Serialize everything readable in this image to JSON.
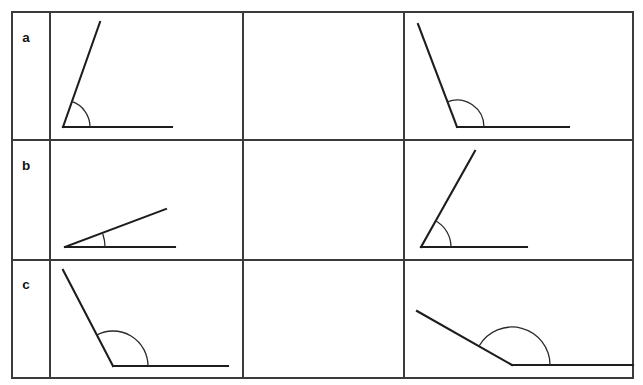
{
  "worksheet": {
    "title": "Angle identification worksheet",
    "background_color": "#ffffff",
    "line_color": "#1d1d1d",
    "grid_color": "#3b3b3b",
    "arc_color": "#2a2a2a",
    "width": 643,
    "height": 385
  },
  "table": {
    "left": 12,
    "top": 12,
    "right": 633,
    "bottom": 378,
    "label_column_divider_x": 50,
    "column_divider_1_x": 243,
    "column_divider_2_x": 404,
    "row_divider_1_y": 140,
    "row_divider_2_y": 260
  },
  "rows": [
    {
      "label": "a",
      "label_x": 26,
      "label_y": 42,
      "cells": [
        {
          "column": 1,
          "empty": false,
          "angle_name": "acute-angle-a1",
          "vertex": [
            63,
            127
          ],
          "ray_horizontal_end": [
            172,
            127
          ],
          "ray_slanted_end": [
            100,
            22
          ],
          "arc_radius": 27,
          "arc_start_deg": 0,
          "arc_end_deg": 71
        },
        {
          "column": 2,
          "empty": true,
          "angle_name": "empty-answer-cell-a2"
        },
        {
          "column": 3,
          "empty": false,
          "angle_name": "obtuse-angle-a3",
          "vertex": [
            457,
            127
          ],
          "ray_horizontal_end": [
            569,
            127
          ],
          "ray_slanted_end": [
            418,
            24
          ],
          "arc_radius": 27,
          "arc_start_deg": 0,
          "arc_end_deg": 111
        }
      ]
    },
    {
      "label": "b",
      "label_x": 26,
      "label_y": 170,
      "cells": [
        {
          "column": 1,
          "empty": false,
          "angle_name": "acute-angle-b1",
          "vertex": [
            65,
            247
          ],
          "ray_horizontal_end": [
            175,
            247
          ],
          "ray_slanted_end": [
            166,
            209
          ],
          "arc_radius": 40,
          "arc_start_deg": 0,
          "arc_end_deg": 19
        },
        {
          "column": 2,
          "empty": true,
          "angle_name": "empty-answer-cell-b2"
        },
        {
          "column": 3,
          "empty": false,
          "angle_name": "acute-angle-b3",
          "vertex": [
            421,
            247
          ],
          "ray_horizontal_end": [
            527,
            247
          ],
          "ray_slanted_end": [
            475,
            151
          ],
          "arc_radius": 30,
          "arc_start_deg": 0,
          "arc_end_deg": 61
        }
      ]
    },
    {
      "label": "c",
      "label_x": 26,
      "label_y": 289,
      "cells": [
        {
          "column": 1,
          "empty": false,
          "angle_name": "obtuse-angle-c1",
          "vertex": [
            113,
            366
          ],
          "ray_horizontal_end": [
            228,
            366
          ],
          "ray_slanted_end": [
            63,
            270
          ],
          "arc_radius": 35,
          "arc_start_deg": 0,
          "arc_end_deg": 118
        },
        {
          "column": 2,
          "empty": true,
          "angle_name": "empty-answer-cell-c2"
        },
        {
          "column": 3,
          "empty": false,
          "angle_name": "obtuse-angle-c3",
          "vertex": [
            512,
            365
          ],
          "ray_horizontal_end": [
            633,
            365
          ],
          "ray_slanted_end": [
            417,
            311
          ],
          "arc_radius": 38,
          "arc_start_deg": 0,
          "arc_end_deg": 150
        }
      ]
    }
  ]
}
